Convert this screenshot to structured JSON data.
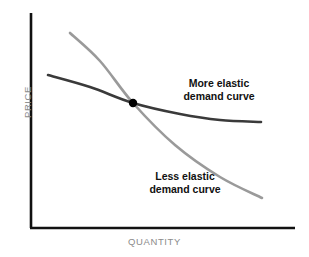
{
  "chart_data": {
    "type": "line",
    "title": "",
    "subtitle": "",
    "xlabel": "QUANTITY",
    "ylabel": "PRICE",
    "xlim": [
      0,
      100
    ],
    "ylim": [
      0,
      100
    ],
    "grid": false,
    "legend_position": "inline-annotations",
    "axis_ticks": {
      "x": [],
      "y": []
    },
    "series": [
      {
        "name": "More elastic demand curve",
        "color": "#3a3a3a",
        "line_width": 2.6,
        "description": "Flatter, gently convex curve sloping down slowly from upper-left and flattening toward the right",
        "points_px": [
          [
            48,
            75
          ],
          [
            90,
            87
          ],
          [
            133,
            103
          ],
          [
            180,
            114
          ],
          [
            220,
            120
          ],
          [
            261,
            122
          ]
        ],
        "points_data": [
          [
            6,
            72
          ],
          [
            22,
            66
          ],
          [
            38,
            58
          ],
          [
            56,
            53
          ],
          [
            71,
            50
          ],
          [
            87,
            49
          ]
        ]
      },
      {
        "name": "Less elastic demand curve",
        "color": "#9a9a9a",
        "line_width": 2.6,
        "description": "Steeper, nearly straight curve falling sharply from upper-left to lower-right",
        "points_px": [
          [
            70,
            33
          ],
          [
            100,
            61
          ],
          [
            133,
            103
          ],
          [
            175,
            145
          ],
          [
            220,
            177
          ],
          [
            262,
            198
          ]
        ],
        "points_data": [
          [
            15,
            91
          ],
          [
            26,
            78
          ],
          [
            38,
            58
          ],
          [
            54,
            39
          ],
          [
            71,
            24
          ],
          [
            88,
            14
          ]
        ]
      }
    ],
    "markers": [
      {
        "name": "intersection-point",
        "x_px": 133,
        "y_px": 103,
        "x_data": 38,
        "y_data": 58,
        "radius": 4.2,
        "color": "#000000",
        "label": ""
      }
    ],
    "annotations": [
      {
        "name": "more-elastic-label",
        "text_lines": [
          "More elastic",
          "demand curve"
        ],
        "x_px": 219,
        "y_px": 89,
        "bold": true,
        "color": "#111111"
      },
      {
        "name": "less-elastic-label",
        "text_lines": [
          "Less elastic",
          "demand curve"
        ],
        "x_px": 185,
        "y_px": 182,
        "bold": true,
        "color": "#111111"
      }
    ],
    "axes_style": {
      "color": "#111111",
      "width": 2.6,
      "origin_px": [
        31,
        228
      ],
      "y_axis_top_px": 13,
      "x_axis_right_px": 295
    }
  },
  "labels": {
    "y_axis": "PRICE",
    "x_axis": "QUANTITY",
    "more_elastic_line1": "More elastic",
    "more_elastic_line2": "demand curve",
    "less_elastic_line1": "Less elastic",
    "less_elastic_line2": "demand curve"
  },
  "colors": {
    "axis": "#111111",
    "more_elastic_curve": "#3a3a3a",
    "less_elastic_curve": "#9a9a9a",
    "intersection_dot": "#000000",
    "axis_title_text": "#8b8b8b",
    "annotation_text": "#111111",
    "background": "#ffffff"
  }
}
